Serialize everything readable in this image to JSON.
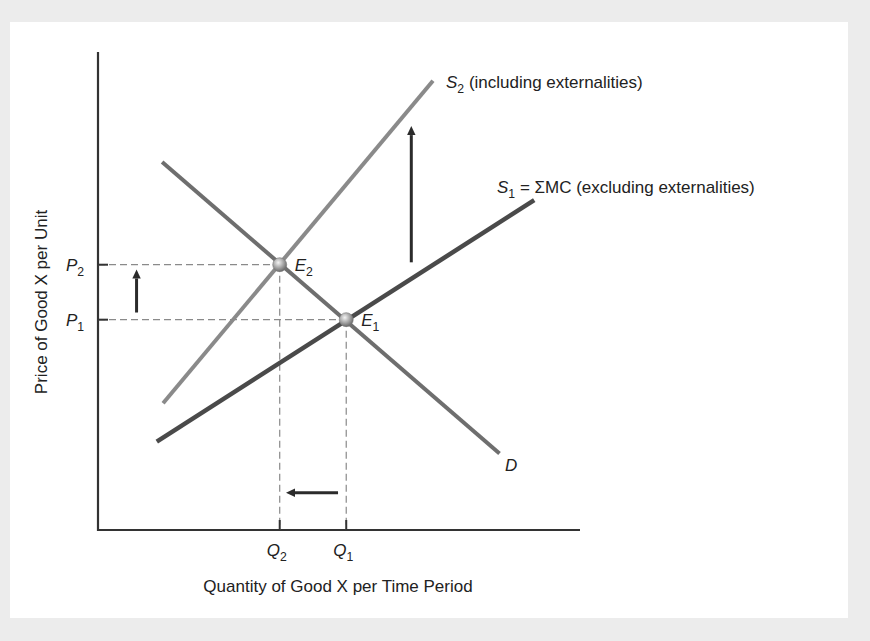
{
  "chart_data": {
    "type": "line",
    "title": "",
    "xlabel": "Quantity of Good X per Time Period",
    "ylabel": "Price of Good X per Unit",
    "xlim": [
      0,
      10
    ],
    "ylim": [
      0,
      10
    ],
    "grid": false,
    "series": [
      {
        "name": "S2 (including externalities)",
        "label_main": "S",
        "label_sub": "2",
        "label_rest": " (including externalities)",
        "color": "#8a8a8a",
        "points": [
          [
            1.35,
            2.65
          ],
          [
            6.95,
            9.4
          ]
        ]
      },
      {
        "name": "S1 = ΣMC (excluding externalities)",
        "label_main": "S",
        "label_sub": "1",
        "label_rest": " = ΣMC (excluding externalities)",
        "color": "#4a4a4a",
        "points": [
          [
            1.22,
            1.85
          ],
          [
            9.05,
            6.9
          ]
        ]
      },
      {
        "name": "D",
        "label_main": "D",
        "label_sub": "",
        "label_rest": "",
        "color": "#6e6e6e",
        "points": [
          [
            1.33,
            7.7
          ],
          [
            8.33,
            1.6
          ]
        ]
      }
    ],
    "equilibria": [
      {
        "name": "E2",
        "label_main": "E",
        "label_sub": "2",
        "x": 3.77,
        "y": 5.55
      },
      {
        "name": "E1",
        "label_main": "E",
        "label_sub": "1",
        "x": 5.15,
        "y": 4.4
      }
    ],
    "x_ticks": [
      {
        "main": "Q",
        "sub": "2",
        "value": 3.77
      },
      {
        "main": "Q",
        "sub": "1",
        "value": 5.15
      }
    ],
    "y_ticks": [
      {
        "main": "P",
        "sub": "2",
        "value": 5.55
      },
      {
        "main": "P",
        "sub": "1",
        "value": 4.4
      }
    ],
    "annotations": [
      {
        "type": "arrow",
        "direction": "up",
        "meaning": "supply shifts up",
        "from": [
          6.5,
          5.6
        ],
        "to": [
          6.5,
          8.45
        ]
      },
      {
        "type": "arrow",
        "direction": "up",
        "meaning": "price rises P1 to P2",
        "from": [
          0.8,
          4.55
        ],
        "to": [
          0.8,
          5.45
        ]
      },
      {
        "type": "arrow",
        "direction": "left",
        "meaning": "quantity falls Q1 to Q2",
        "from": [
          4.98,
          0.78
        ],
        "to": [
          3.9,
          0.78
        ]
      }
    ]
  }
}
